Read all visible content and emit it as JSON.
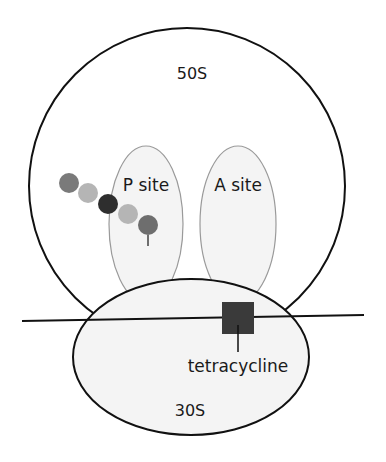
{
  "diagram": {
    "large_subunit": {
      "label": "50S"
    },
    "small_subunit": {
      "label": "30S"
    },
    "sites": [
      {
        "label": "P site"
      },
      {
        "label": "A site"
      }
    ],
    "drug": {
      "label": "tetracycline",
      "color": "#3a3a3a"
    },
    "peptide_chain": {
      "beads": [
        {
          "color": "#7a7a7a"
        },
        {
          "color": "#b5b5b5"
        },
        {
          "color": "#2e2e2e"
        },
        {
          "color": "#b5b5b5"
        },
        {
          "color": "#6e6e6e"
        }
      ]
    },
    "colors": {
      "outline": "#111111",
      "site_outline": "#9a9a9a",
      "fill_light": "#f4f4f4"
    }
  }
}
